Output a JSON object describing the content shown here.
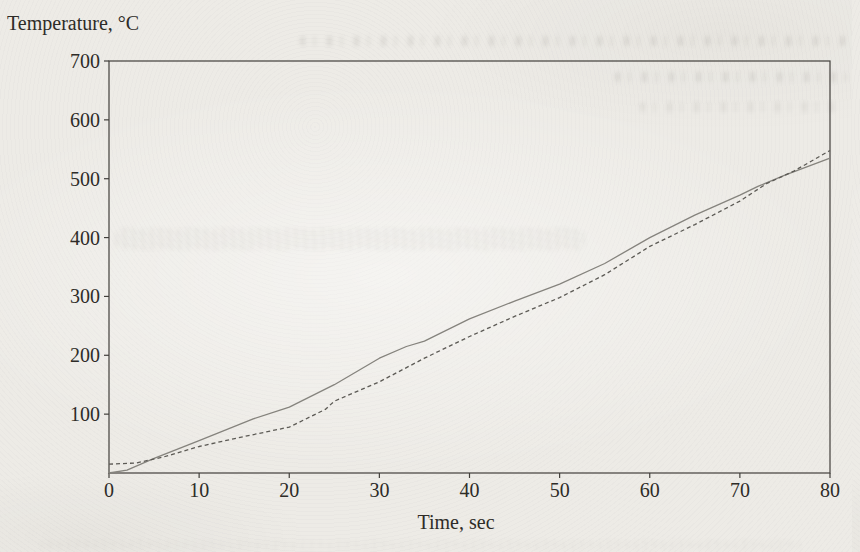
{
  "page": {
    "y_axis_title": "Temperature, °C",
    "x_axis_title": "Time, sec"
  },
  "chart_data": {
    "type": "line",
    "title": "",
    "xlabel": "Time, sec",
    "ylabel": "Temperature, °C",
    "xlim": [
      0,
      80
    ],
    "ylim": [
      0,
      700
    ],
    "x_tick_values": [
      0,
      10,
      20,
      30,
      40,
      50,
      60,
      70,
      80
    ],
    "y_tick_values": [
      100,
      200,
      300,
      400,
      500,
      600,
      700
    ],
    "grid": false,
    "legend_position": "none",
    "frame": "full-box",
    "series": [
      {
        "name": "solid heating curve",
        "style": "solid",
        "color": "#85837d",
        "points": [
          [
            0,
            0
          ],
          [
            2,
            5
          ],
          [
            5,
            25
          ],
          [
            10,
            55
          ],
          [
            16,
            92
          ],
          [
            20,
            112
          ],
          [
            25,
            150
          ],
          [
            30,
            195
          ],
          [
            33,
            215
          ],
          [
            35,
            224
          ],
          [
            40,
            262
          ],
          [
            45,
            292
          ],
          [
            50,
            321
          ],
          [
            55,
            356
          ],
          [
            60,
            400
          ],
          [
            65,
            438
          ],
          [
            70,
            472
          ],
          [
            72,
            487
          ],
          [
            75,
            506
          ],
          [
            80,
            535
          ]
        ]
      },
      {
        "name": "dashed heating curve",
        "style": "dashed",
        "color": "#5c5a55",
        "points": [
          [
            0,
            15
          ],
          [
            3,
            17
          ],
          [
            6,
            27
          ],
          [
            10,
            45
          ],
          [
            15,
            62
          ],
          [
            20,
            78
          ],
          [
            24,
            108
          ],
          [
            25,
            122
          ],
          [
            30,
            155
          ],
          [
            35,
            195
          ],
          [
            40,
            232
          ],
          [
            45,
            266
          ],
          [
            50,
            298
          ],
          [
            55,
            337
          ],
          [
            60,
            385
          ],
          [
            65,
            422
          ],
          [
            70,
            462
          ],
          [
            73,
            492
          ],
          [
            76,
            513
          ],
          [
            80,
            548
          ]
        ]
      }
    ],
    "colors": {
      "axis_frame": "#413f3b",
      "tick_text": "#2e2c28"
    }
  }
}
